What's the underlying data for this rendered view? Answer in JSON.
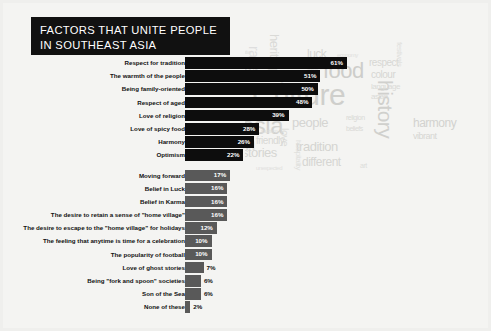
{
  "title": {
    "line1": "FACTORS THAT UNITE PEOPLE",
    "line2": "IN SOUTHEAST ASIA"
  },
  "colors": {
    "primary_bar": "#0d0d0d",
    "secondary_bar": "#595959",
    "title_background": "#111111",
    "page_background": "#f4f4f2",
    "cloud_text": "#d8d8d6"
  },
  "chart_data": {
    "type": "bar",
    "title": "FACTORS THAT UNITE PEOPLE IN SOUTHEAST ASIA",
    "xlabel": "",
    "ylabel": "",
    "xlim": [
      0,
      61
    ],
    "grid": false,
    "legend": "none",
    "orientation": "horizontal",
    "categories": [
      "Respect for tradition",
      "The warmth of the people",
      "Being family-oriented",
      "Respect of aged",
      "Love of religion",
      "Love of spicy food",
      "Harmony",
      "Optimism",
      "Moving forward",
      "Belief in Luck",
      "Belief in Karma",
      "The desire to retain a sense of \"home village\"",
      "The desire to escape to the \"home village\" for holidays",
      "The feeling that anytime is time for a celebration",
      "The popularity of football",
      "Love of ghost stories",
      "Being \"fork and spoon\" societies",
      "Son of the Sea",
      "None of these"
    ],
    "values": [
      61,
      51,
      50,
      48,
      39,
      28,
      26,
      22,
      17,
      16,
      16,
      16,
      12,
      10,
      10,
      7,
      6,
      6,
      2
    ],
    "value_labels": [
      "61%",
      "51%",
      "50%",
      "48%",
      "39%",
      "28%",
      "26%",
      "22%",
      "17%",
      "16%",
      "16%",
      "16%",
      "12%",
      "10%",
      "10%",
      "7%",
      "6%",
      "6%",
      "2%"
    ],
    "groups": [
      "primary",
      "primary",
      "primary",
      "primary",
      "primary",
      "primary",
      "primary",
      "primary",
      "secondary",
      "secondary",
      "secondary",
      "secondary",
      "secondary",
      "secondary",
      "secondary",
      "secondary",
      "secondary",
      "secondary",
      "secondary"
    ]
  },
  "word_cloud": {
    "words": [
      {
        "text": "Culture",
        "size": 30,
        "x": 7,
        "y": 58,
        "shade": "#cfcfcc",
        "rotate": 0
      },
      {
        "text": "asia",
        "size": 24,
        "x": -4,
        "y": 92,
        "shade": "#d2d2cf",
        "rotate": 0
      },
      {
        "text": "food",
        "size": 22,
        "x": 78,
        "y": 38,
        "shade": "#cdcdca",
        "rotate": 0
      },
      {
        "text": "history",
        "size": 21,
        "x": 151,
        "y": 58,
        "shade": "#d0d0cd",
        "rotate": 90
      },
      {
        "text": "an",
        "size": 20,
        "x": -8,
        "y": 35,
        "shade": "#dcdcd9",
        "rotate": 0
      },
      {
        "text": "un",
        "size": 19,
        "x": -10,
        "y": 112,
        "shade": "#dbdbd8",
        "rotate": 0
      },
      {
        "text": "people",
        "size": 13,
        "x": 47,
        "y": 94,
        "shade": "#d5d5d2",
        "rotate": 0
      },
      {
        "text": "tradition",
        "size": 13,
        "x": 51,
        "y": 118,
        "shade": "#d4d4d1",
        "rotate": 0
      },
      {
        "text": "stories",
        "size": 13,
        "x": -3,
        "y": 124,
        "shade": "#d6d6d3",
        "rotate": 0
      },
      {
        "text": "different",
        "size": 12,
        "x": 57,
        "y": 134,
        "shade": "#d6d6d3",
        "rotate": 0
      },
      {
        "text": "harmony",
        "size": 12,
        "x": 168,
        "y": 95,
        "shade": "#d2d2cf",
        "rotate": 0
      },
      {
        "text": "heritage",
        "size": 13,
        "x": 36,
        "y": 12,
        "shade": "#dadad7",
        "rotate": 90
      },
      {
        "text": "luck",
        "size": 12,
        "x": 62,
        "y": 26,
        "shade": "#d6d6d3",
        "rotate": 0
      },
      {
        "text": "respect",
        "size": 10,
        "x": 124,
        "y": 36,
        "shade": "#d7d7d4",
        "rotate": 0
      },
      {
        "text": "colour",
        "size": 10,
        "x": 126,
        "y": 48,
        "shade": "#d6d6d3",
        "rotate": 0
      },
      {
        "text": "language",
        "size": 8,
        "x": 126,
        "y": 61,
        "shade": "#dadad7",
        "rotate": 0
      },
      {
        "text": "asian",
        "size": 8,
        "x": 126,
        "y": 71,
        "shade": "#dadad7",
        "rotate": 0
      },
      {
        "text": "vibrant",
        "size": 9,
        "x": 168,
        "y": 110,
        "shade": "#d6d6d3",
        "rotate": 0
      },
      {
        "text": "race",
        "size": 14,
        "x": 16,
        "y": 24,
        "shade": "#dedede",
        "rotate": 90
      },
      {
        "text": "love",
        "size": 11,
        "x": 45,
        "y": 106,
        "shade": "#dcdcd9",
        "rotate": 90
      },
      {
        "text": "hospitality",
        "size": 8,
        "x": 57,
        "y": 118,
        "shade": "#e0e0dd",
        "rotate": 90
      },
      {
        "text": "festivals",
        "size": 8,
        "x": 158,
        "y": 20,
        "shade": "#e0e0dd",
        "rotate": 90
      },
      {
        "text": "religion",
        "size": 7,
        "x": 101,
        "y": 92,
        "shade": "#dadad7",
        "rotate": 0
      },
      {
        "text": "beliefs",
        "size": 7,
        "x": 101,
        "y": 103,
        "shade": "#dadad7",
        "rotate": 0
      },
      {
        "text": "tourism",
        "size": 6,
        "x": 16,
        "y": 106,
        "shade": "#dddddb",
        "rotate": 0
      },
      {
        "text": "friendly",
        "size": 10,
        "x": 11,
        "y": 114,
        "shade": "#d8d8d5",
        "rotate": 0
      },
      {
        "text": "unexpected",
        "size": 6,
        "x": 11,
        "y": 143,
        "shade": "#e1e1de",
        "rotate": 0
      },
      {
        "text": "art",
        "size": 7,
        "x": 115,
        "y": 140,
        "shade": "#dddddb",
        "rotate": 0
      },
      {
        "text": "economy",
        "size": 6,
        "x": 92,
        "y": 30,
        "shade": "#e0e0dd",
        "rotate": 0
      },
      {
        "text": "sports",
        "size": 5,
        "x": 62,
        "y": 44,
        "shade": "#e2e2df",
        "rotate": 0
      },
      {
        "text": "relative",
        "size": 5,
        "x": -6,
        "y": 28,
        "shade": "#e2e2df",
        "rotate": 0
      },
      {
        "text": "my",
        "size": 12,
        "x": 26,
        "y": 48,
        "shade": "#e0e0dd",
        "rotate": 0
      }
    ]
  }
}
